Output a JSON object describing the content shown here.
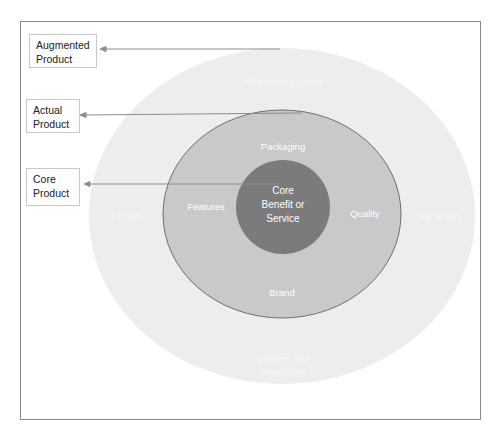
{
  "diagram": {
    "title_labels": [
      {
        "id": "augmented",
        "text": "Augmented Product"
      },
      {
        "id": "actual",
        "text": "Actual Product"
      },
      {
        "id": "core",
        "text": "Core Product"
      }
    ],
    "rings": {
      "outer": {
        "name": "Augmented Product",
        "fill": "#ededed",
        "items": [
          "After-sales support",
          "Credit",
          "Warranties",
          "Delivery and Installation"
        ]
      },
      "middle": {
        "name": "Actual Product",
        "fill": "#c7c7c7",
        "stroke": "#6e6e6e",
        "items": [
          "Packaging",
          "Features",
          "Quality",
          "Brand"
        ]
      },
      "inner": {
        "name": "Core Benefit or Service",
        "fill": "#7b7b7b",
        "lines": [
          "Core",
          "Benefit or",
          "Service"
        ]
      }
    },
    "labels": {
      "augmented_line1": "Augmented",
      "augmented_line2": "Product",
      "actual_line1": "Actual",
      "actual_line2": "Product",
      "core_line1": "Core",
      "core_line2": "Product",
      "after_sales": "After-sales support",
      "credit": "Credit",
      "warranties": "Warranties",
      "delivery_line1": "Delivery and",
      "delivery_line2": "Installation",
      "packaging": "Packaging",
      "features": "Features",
      "quality": "Quality",
      "brand": "Brand",
      "core_c1": "Core",
      "core_c2": "Benefit or",
      "core_c3": "Service"
    },
    "colors": {
      "frame": "#8a8a8a",
      "arrow": "#8c8c8c",
      "box_border": "#c8c8c8"
    }
  }
}
